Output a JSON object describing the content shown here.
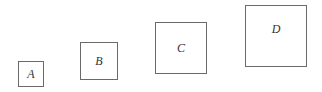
{
  "squares": [
    {
      "label": "A",
      "x": 18,
      "y": 61,
      "size": 26
    },
    {
      "label": "B",
      "x": 80,
      "y": 42,
      "size": 38
    },
    {
      "label": "C",
      "x": 155,
      "y": 22,
      "size": 52
    },
    {
      "label": "D",
      "x": 245,
      "y": 5,
      "size": 62
    }
  ]
}
